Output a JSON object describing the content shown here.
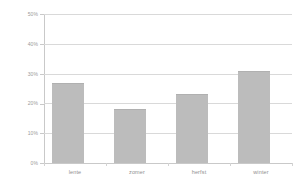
{
  "chart_data": {
    "type": "bar",
    "title": "",
    "subtitle": "",
    "xlabel": "",
    "ylabel": "",
    "categories": [
      "lente",
      "zomer",
      "herfst",
      "winter"
    ],
    "values": [
      27,
      18,
      23,
      31
    ],
    "value_suffix": "%",
    "ylim": [
      0,
      50
    ],
    "yticks": [
      0,
      10,
      20,
      30,
      40,
      50
    ],
    "ytick_labels": [
      "0%",
      "10%",
      "20%",
      "30%",
      "40%",
      "50%"
    ],
    "grid": true,
    "legend": false,
    "legend_position": "none",
    "series": [
      {
        "name": "",
        "values": [
          27,
          18,
          23,
          31
        ]
      }
    ],
    "colors": {
      "bar": "#bcbcbc",
      "bar_edge": "#b0b0b0",
      "grid": "#d9d9d9",
      "axis": "#c9c9c9",
      "tick_text": "#9a9a9a",
      "category_text": "#8f8f8f",
      "background": "#ffffff"
    }
  }
}
